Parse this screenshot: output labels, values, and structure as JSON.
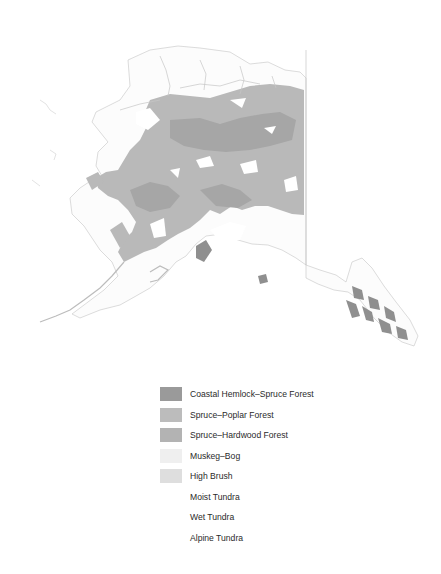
{
  "map": {
    "subject": "Alaska vegetation map",
    "colors": {
      "outline": "#b8b8b8",
      "land": "#fafafa",
      "coastal_hemlock_spruce": "#8f8f8f",
      "spruce_poplar": "#bdbdbd",
      "spruce_hardwood": "#b1b1b1",
      "muskeg_bog": "#efefef",
      "high_brush": "#dcdcdc"
    }
  },
  "legend": {
    "items": [
      {
        "label": "Coastal Hemlock–Spruce Forest",
        "color": "#9a9a9a"
      },
      {
        "label": "Spruce–Poplar Forest",
        "color": "#bcbcbc"
      },
      {
        "label": "Spruce–Hardwood Forest",
        "color": "#b3b3b3"
      },
      {
        "label": "Muskeg–Bog",
        "color": "#efefef"
      },
      {
        "label": "High Brush",
        "color": "#dedede"
      },
      {
        "label": "Moist Tundra",
        "color": "#ffffff"
      },
      {
        "label": "Wet Tundra",
        "color": "#ffffff"
      },
      {
        "label": "Alpine Tundra",
        "color": "#ffffff"
      }
    ]
  }
}
